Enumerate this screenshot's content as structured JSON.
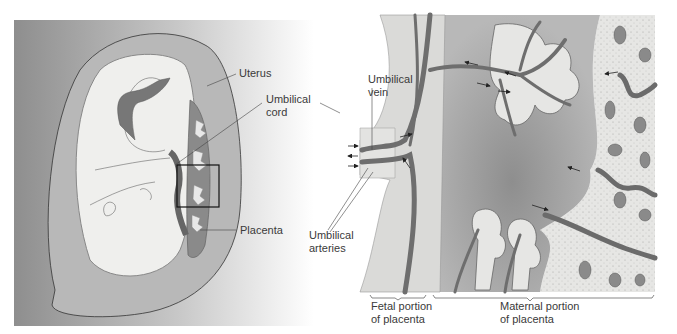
{
  "figure": {
    "left_panel": {
      "description": "Fetus in uterus, cross-section",
      "labels": {
        "uterus": "Uterus",
        "umbilical_cord": "Umbilical\ncord",
        "placenta": "Placenta"
      }
    },
    "right_panel": {
      "description": "Enlarged section of placenta",
      "labels": {
        "umbilical_vein": "Umbilical\nvein",
        "umbilical_arteries": "Umbilical\narteries",
        "fetal_portion": "Fetal portion\nof placenta",
        "maternal_portion": "Maternal portion\nof placenta"
      }
    },
    "colors": {
      "background_gray": "#8f8f8f",
      "uterus_wall": "#b4b4b4",
      "amniotic_fill": "#eeeeec",
      "vessel": "#6e6e6e",
      "vessel_dark": "#4a4a4a",
      "maternal_blood": "#a9a9a9",
      "maternal_tissue": "#e4e4e2",
      "text": "#3a3a3a"
    }
  }
}
